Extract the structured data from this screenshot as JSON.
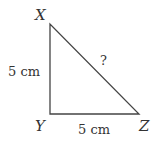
{
  "diagram": {
    "type": "right-triangle",
    "vertices": {
      "X": {
        "label": "X"
      },
      "Y": {
        "label": "Y"
      },
      "Z": {
        "label": "Z"
      }
    },
    "sides": {
      "XY": {
        "label": "5 cm"
      },
      "YZ": {
        "label": "5 cm"
      },
      "XZ": {
        "label": "?"
      }
    },
    "colors": {
      "stroke": "#444444",
      "text": "#333333",
      "background": "#ffffff"
    }
  }
}
